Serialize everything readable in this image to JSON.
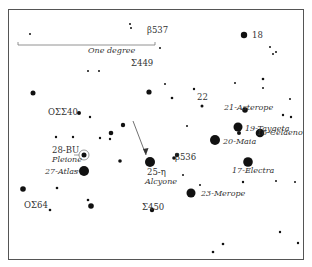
{
  "scale_bar": {
    "label": "One degree",
    "x1": 18,
    "x2": 155,
    "y": 45
  },
  "labels": {
    "b3537": "β537",
    "s449": "Σ449",
    "oss40": "OΣΣ40",
    "bu28": "28-BU",
    "pleione": "Pleione",
    "atlas": "27-Atlas",
    "oss64": "OΣ64",
    "alcyone_num": "25-η",
    "alcyone": "Alcyone",
    "b536": "β536",
    "s450": "Σ450",
    "merope": "23-Merope",
    "electra": "17-Electra",
    "celaeno": "16-Celaeno",
    "maia": "20-Maia",
    "taygeta": "19-Taygeta",
    "asterope": "21-Asterope",
    "s22": "22",
    "s18": "18"
  },
  "stars": [
    {
      "x": 244,
      "y": 35,
      "r": 3.2
    },
    {
      "x": 149,
      "y": 92,
      "r": 2.6
    },
    {
      "x": 245,
      "y": 110,
      "r": 2.8
    },
    {
      "x": 238,
      "y": 127,
      "r": 4.5
    },
    {
      "x": 215,
      "y": 140,
      "r": 5
    },
    {
      "x": 239,
      "y": 133,
      "r": 2
    },
    {
      "x": 260,
      "y": 133,
      "r": 4.3
    },
    {
      "x": 248,
      "y": 162,
      "r": 4.8
    },
    {
      "x": 191,
      "y": 193,
      "r": 4.5
    },
    {
      "x": 150,
      "y": 162,
      "r": 5
    },
    {
      "x": 84,
      "y": 171,
      "r": 5
    },
    {
      "x": 84,
      "y": 155,
      "r": 2.5
    },
    {
      "x": 177,
      "y": 155,
      "r": 2.2
    },
    {
      "x": 174,
      "y": 158,
      "r": 1.8
    },
    {
      "x": 23,
      "y": 189,
      "r": 2.8
    },
    {
      "x": 91,
      "y": 206,
      "r": 2.8
    },
    {
      "x": 33,
      "y": 93,
      "r": 2.5
    },
    {
      "x": 111,
      "y": 133,
      "r": 2.3
    },
    {
      "x": 123,
      "y": 125,
      "r": 2.2
    },
    {
      "x": 79,
      "y": 113,
      "r": 2
    },
    {
      "x": 120,
      "y": 161,
      "r": 1.8
    },
    {
      "x": 152,
      "y": 210,
      "r": 2.2
    },
    {
      "x": 243,
      "y": 182,
      "r": 1.2
    },
    {
      "x": 172,
      "y": 98,
      "r": 1.3
    },
    {
      "x": 202,
      "y": 106,
      "r": 1.5
    },
    {
      "x": 213,
      "y": 252,
      "r": 1.3
    },
    {
      "x": 223,
      "y": 244,
      "r": 1.3
    },
    {
      "x": 194,
      "y": 89,
      "r": 1.2
    },
    {
      "x": 50,
      "y": 210,
      "r": 1.3
    },
    {
      "x": 88,
      "y": 200,
      "r": 1.3
    },
    {
      "x": 57,
      "y": 188,
      "r": 1.3
    },
    {
      "x": 90,
      "y": 117,
      "r": 1.2
    },
    {
      "x": 56,
      "y": 137,
      "r": 1.2
    },
    {
      "x": 73,
      "y": 137,
      "r": 1.2
    },
    {
      "x": 100,
      "y": 138,
      "r": 1.2
    },
    {
      "x": 110,
      "y": 139,
      "r": 1.2
    },
    {
      "x": 160,
      "y": 48,
      "r": 1
    },
    {
      "x": 131,
      "y": 28,
      "r": 1
    },
    {
      "x": 130,
      "y": 24,
      "r": 1
    },
    {
      "x": 30,
      "y": 34,
      "r": 1
    },
    {
      "x": 88,
      "y": 71,
      "r": 1
    },
    {
      "x": 99,
      "y": 71,
      "r": 1
    },
    {
      "x": 270,
      "y": 47,
      "r": 1
    },
    {
      "x": 273,
      "y": 54,
      "r": 1
    },
    {
      "x": 276,
      "y": 52,
      "r": 1
    },
    {
      "x": 235,
      "y": 83,
      "r": 1
    },
    {
      "x": 263,
      "y": 79,
      "r": 1.3
    },
    {
      "x": 290,
      "y": 99,
      "r": 1
    },
    {
      "x": 291,
      "y": 117,
      "r": 1.2
    },
    {
      "x": 283,
      "y": 115,
      "r": 1.2
    },
    {
      "x": 295,
      "y": 182,
      "r": 1
    },
    {
      "x": 276,
      "y": 181,
      "r": 1
    },
    {
      "x": 280,
      "y": 232,
      "r": 1.2
    },
    {
      "x": 298,
      "y": 243,
      "r": 1.2
    },
    {
      "x": 187,
      "y": 126,
      "r": 1
    },
    {
      "x": 263,
      "y": 88,
      "r": 1
    },
    {
      "x": 165,
      "y": 84,
      "r": 1
    },
    {
      "x": 200,
      "y": 185,
      "r": 1
    },
    {
      "x": 183,
      "y": 175,
      "r": 1
    }
  ],
  "arrow": {
    "x1": 133,
    "y1": 121,
    "x2": 146,
    "y2": 155
  }
}
